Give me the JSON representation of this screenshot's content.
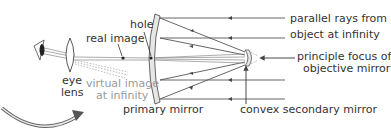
{
  "labels": {
    "hole": "hole",
    "real_image": "real image",
    "eye_line1": "eye",
    "eye_line2": "lens",
    "virtual_line1": "virtual image",
    "virtual_line2": "at infinity",
    "primary_mirror": "primary mirror",
    "convex_secondary": "convex secondary mirror",
    "parallel_line1": "parallel rays from",
    "parallel_line2": "object at infinity",
    "focus_line1": "principle focus of",
    "focus_line2": "objective mirror"
  },
  "colors": {
    "ink": "#333333",
    "faint": "#9a9a9a",
    "ray": "#555555",
    "mirror_fill": "#e6e6e6"
  }
}
